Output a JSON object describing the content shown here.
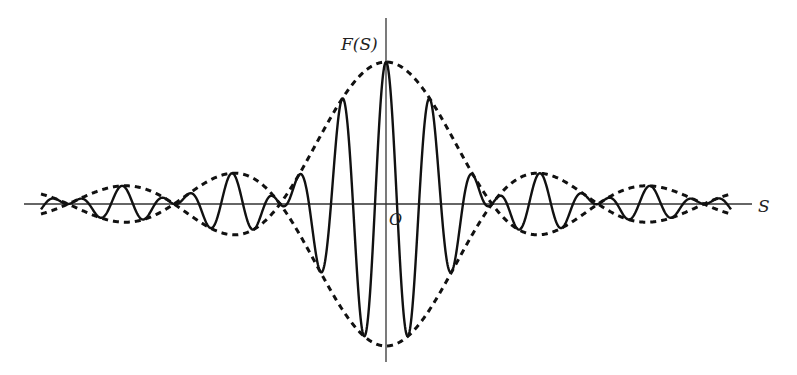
{
  "figure": {
    "y_axis_label": "F(S)",
    "x_axis_label": "S",
    "origin_label": "O",
    "colors": {
      "curve": "#111111",
      "axis": "#333333",
      "background": "#ffffff"
    }
  },
  "geometry": {
    "origin_x": 386,
    "baseline_y": 204,
    "x_axis_start": 24,
    "x_axis_end": 752,
    "y_axis_top": 18,
    "y_axis_bottom": 362,
    "envelope_amplitude_px": 142,
    "envelope_zero_spacing_px": 106,
    "carrier_period_px": 44,
    "plot_half_width_px": 345
  },
  "curves": [
    {
      "name": "envelope-upper",
      "style": "dashed",
      "formula": "+A*sinc(x/zero_spacing)"
    },
    {
      "name": "envelope-lower",
      "style": "dashed",
      "formula": "-A*sinc(x/zero_spacing)"
    },
    {
      "name": "interferogram",
      "style": "solid",
      "formula": "A*sinc(x/zero_spacing)*cos(2*pi*x/period)"
    }
  ]
}
